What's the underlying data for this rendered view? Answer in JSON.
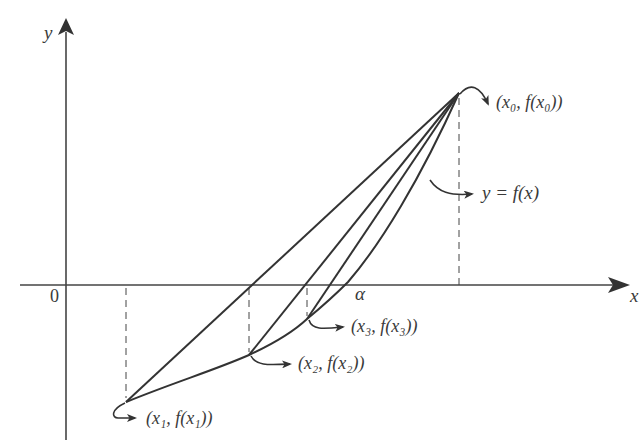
{
  "diagram": {
    "type": "secant-method-illustration",
    "colors": {
      "stroke": "#333333",
      "text": "#3a3a3a",
      "background": "#ffffff"
    },
    "axes": {
      "x_label": "x",
      "y_label": "y",
      "origin_label": "0"
    },
    "curve_label": "y = f(x)",
    "root_label": "α",
    "points": [
      {
        "id": "p0",
        "label": "(x₀, f(x₀))"
      },
      {
        "id": "p1",
        "label": "(x₁, f(x₁))"
      },
      {
        "id": "p2",
        "label": "(x₂, f(x₂))"
      },
      {
        "id": "p3",
        "label": "(x₃, f(x₃))"
      }
    ]
  }
}
